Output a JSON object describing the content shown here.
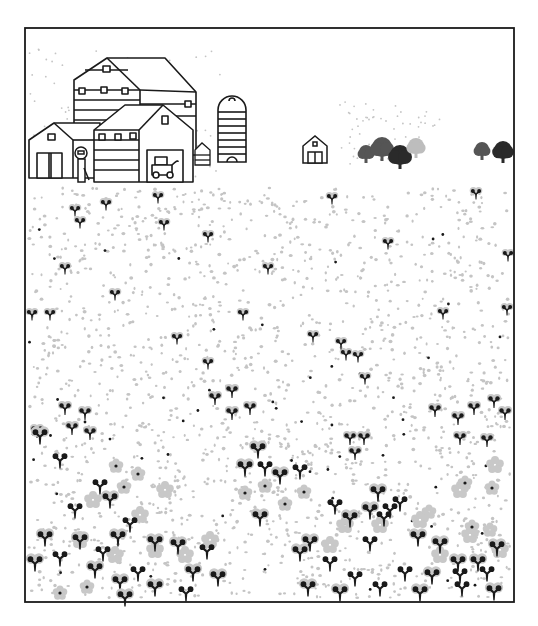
{
  "illustration": {
    "title": "Farm buildings beside a flower field",
    "colors": {
      "background": "#ffffff",
      "ink": "#1a1a1a",
      "dot_gray": "#c4c4c4",
      "flower_gray": "#c8c8c8",
      "tree_dark": "#2a2a2a",
      "tree_mid": "#555555",
      "tree_light": "#bdbdbd"
    },
    "frame": {
      "x": 25,
      "y": 28,
      "w": 489,
      "h": 574
    },
    "horizon_y": 180,
    "trees": [
      {
        "x": 366,
        "y": 152,
        "r": 7,
        "shade": "tree_mid"
      },
      {
        "x": 382,
        "y": 147,
        "r": 10,
        "shade": "tree_mid"
      },
      {
        "x": 400,
        "y": 155,
        "r": 10,
        "shade": "tree_dark"
      },
      {
        "x": 416,
        "y": 146,
        "r": 8,
        "shade": "tree_light"
      },
      {
        "x": 482,
        "y": 149,
        "r": 7,
        "shade": "tree_mid"
      },
      {
        "x": 503,
        "y": 150,
        "r": 9,
        "shade": "tree_dark"
      }
    ],
    "far_barn": {
      "x": 303,
      "y": 136,
      "w": 24,
      "h": 27
    },
    "silo": {
      "x": 218,
      "y": 96,
      "w": 28,
      "h": 66
    },
    "small_flowers": [
      [
        75,
        212
      ],
      [
        80,
        224
      ],
      [
        106,
        206
      ],
      [
        158,
        199
      ],
      [
        164,
        226
      ],
      [
        208,
        238
      ],
      [
        65,
        270
      ],
      [
        115,
        296
      ],
      [
        268,
        270
      ],
      [
        243,
        316
      ],
      [
        32,
        316
      ],
      [
        50,
        316
      ],
      [
        177,
        340
      ],
      [
        208,
        365
      ],
      [
        332,
        200
      ],
      [
        388,
        245
      ],
      [
        476,
        195
      ],
      [
        443,
        315
      ],
      [
        508,
        257
      ],
      [
        507,
        311
      ],
      [
        313,
        338
      ],
      [
        346,
        356
      ],
      [
        358,
        358
      ],
      [
        365,
        380
      ],
      [
        341,
        345
      ]
    ],
    "clusters": [
      [
        65,
        410
      ],
      [
        85,
        415
      ],
      [
        37,
        433
      ],
      [
        72,
        430
      ],
      [
        90,
        435
      ],
      [
        215,
        400
      ],
      [
        232,
        393
      ],
      [
        250,
        410
      ],
      [
        232,
        415
      ],
      [
        350,
        440
      ],
      [
        364,
        440
      ],
      [
        355,
        455
      ],
      [
        435,
        412
      ],
      [
        458,
        420
      ],
      [
        474,
        410
      ],
      [
        494,
        403
      ],
      [
        505,
        415
      ],
      [
        460,
        440
      ],
      [
        487,
        442
      ]
    ],
    "blooms": [
      {
        "x": 116,
        "y": 466,
        "pale": false
      },
      {
        "x": 138,
        "y": 474,
        "pale": false
      },
      {
        "x": 124,
        "y": 487,
        "pale": false
      },
      {
        "x": 285,
        "y": 504,
        "pale": false
      },
      {
        "x": 304,
        "y": 492,
        "pale": false
      },
      {
        "x": 465,
        "y": 483,
        "pale": false
      },
      {
        "x": 472,
        "y": 527,
        "pale": false
      },
      {
        "x": 245,
        "y": 493,
        "pale": false
      },
      {
        "x": 265,
        "y": 486,
        "pale": false
      },
      {
        "x": 490,
        "y": 530,
        "pale": true
      },
      {
        "x": 429,
        "y": 512,
        "pale": true
      },
      {
        "x": 492,
        "y": 488,
        "pale": false
      },
      {
        "x": 87,
        "y": 587,
        "pale": false
      },
      {
        "x": 60,
        "y": 593,
        "pale": false
      }
    ],
    "butterflies": [
      [
        40,
        438
      ],
      [
        60,
        462
      ],
      [
        100,
        488
      ],
      [
        110,
        502
      ],
      [
        75,
        512
      ],
      [
        130,
        526
      ],
      [
        118,
        540
      ],
      [
        103,
        555
      ],
      [
        80,
        543
      ],
      [
        45,
        540
      ],
      [
        155,
        545
      ],
      [
        178,
        548
      ],
      [
        138,
        575
      ],
      [
        120,
        585
      ],
      [
        95,
        572
      ],
      [
        60,
        560
      ],
      [
        35,
        565
      ],
      [
        155,
        590
      ],
      [
        125,
        600
      ],
      [
        193,
        575
      ],
      [
        218,
        580
      ],
      [
        186,
        595
      ],
      [
        207,
        553
      ],
      [
        245,
        470
      ],
      [
        265,
        470
      ],
      [
        280,
        478
      ],
      [
        258,
        452
      ],
      [
        300,
        473
      ],
      [
        335,
        508
      ],
      [
        350,
        521
      ],
      [
        370,
        513
      ],
      [
        378,
        495
      ],
      [
        310,
        545
      ],
      [
        330,
        565
      ],
      [
        370,
        545
      ],
      [
        355,
        580
      ],
      [
        380,
        590
      ],
      [
        405,
        575
      ],
      [
        432,
        578
      ],
      [
        458,
        565
      ],
      [
        478,
        565
      ],
      [
        390,
        512
      ],
      [
        400,
        505
      ],
      [
        418,
        540
      ],
      [
        440,
        547
      ],
      [
        460,
        577
      ],
      [
        487,
        575
      ],
      [
        497,
        550
      ],
      [
        494,
        594
      ],
      [
        462,
        590
      ],
      [
        420,
        595
      ],
      [
        384,
        520
      ],
      [
        260,
        520
      ],
      [
        300,
        555
      ],
      [
        308,
        590
      ],
      [
        340,
        595
      ]
    ],
    "blooms_gray_light": [
      [
        80,
        545
      ],
      [
        115,
        560
      ],
      [
        155,
        555
      ],
      [
        185,
        560
      ],
      [
        210,
        545
      ],
      [
        330,
        550
      ],
      [
        345,
        530
      ],
      [
        380,
        530
      ],
      [
        420,
        525
      ],
      [
        440,
        560
      ],
      [
        470,
        540
      ],
      [
        500,
        555
      ],
      [
        140,
        520
      ],
      [
        165,
        495
      ],
      [
        93,
        505
      ],
      [
        460,
        495
      ],
      [
        495,
        470
      ]
    ]
  }
}
